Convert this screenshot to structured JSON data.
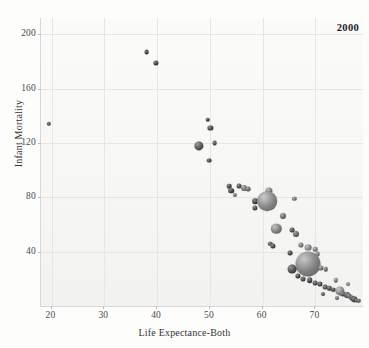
{
  "chart_data": {
    "type": "scatter",
    "title": "",
    "annotation": "2000",
    "xlabel": "Life Expectance-Both",
    "ylabel": "Infant Mortality",
    "xlim": [
      18,
      79
    ],
    "ylim": [
      0,
      212
    ],
    "xticks": [
      20,
      30,
      40,
      50,
      60,
      70
    ],
    "yticks": [
      40,
      80,
      120,
      160,
      200
    ],
    "grid": true,
    "legend": "none",
    "bubble_encoding": "marker size encodes population; shading is grayscale sphere",
    "points": [
      {
        "x": 19.5,
        "y": 134,
        "r": 2.2,
        "tone": 0.3
      },
      {
        "x": 38.0,
        "y": 187,
        "r": 2.4,
        "tone": 0.22
      },
      {
        "x": 39.8,
        "y": 179,
        "r": 2.6,
        "tone": 0.25
      },
      {
        "x": 49.6,
        "y": 137,
        "r": 2.3,
        "tone": 0.24
      },
      {
        "x": 50.1,
        "y": 131,
        "r": 2.6,
        "tone": 0.28
      },
      {
        "x": 50.9,
        "y": 120,
        "r": 2.4,
        "tone": 0.3
      },
      {
        "x": 47.9,
        "y": 118,
        "r": 4.6,
        "tone": 0.34
      },
      {
        "x": 49.9,
        "y": 107,
        "r": 2.4,
        "tone": 0.26
      },
      {
        "x": 53.6,
        "y": 88,
        "r": 2.3,
        "tone": 0.26
      },
      {
        "x": 54.0,
        "y": 85,
        "r": 2.8,
        "tone": 0.24
      },
      {
        "x": 54.8,
        "y": 82,
        "r": 2.1,
        "tone": 0.48
      },
      {
        "x": 55.6,
        "y": 88,
        "r": 2.5,
        "tone": 0.3
      },
      {
        "x": 56.4,
        "y": 87,
        "r": 3.0,
        "tone": 0.52
      },
      {
        "x": 57.3,
        "y": 86,
        "r": 2.4,
        "tone": 0.44
      },
      {
        "x": 61.2,
        "y": 85,
        "r": 3.6,
        "tone": 0.56
      },
      {
        "x": 58.6,
        "y": 77,
        "r": 2.8,
        "tone": 0.26
      },
      {
        "x": 58.5,
        "y": 72,
        "r": 2.6,
        "tone": 0.3
      },
      {
        "x": 60.8,
        "y": 77,
        "r": 9.8,
        "tone": 0.62
      },
      {
        "x": 66.0,
        "y": 79,
        "r": 2.2,
        "tone": 0.5
      },
      {
        "x": 63.9,
        "y": 66,
        "r": 3.0,
        "tone": 0.46
      },
      {
        "x": 62.6,
        "y": 57,
        "r": 5.2,
        "tone": 0.58
      },
      {
        "x": 65.6,
        "y": 56,
        "r": 2.4,
        "tone": 0.3
      },
      {
        "x": 66.4,
        "y": 53,
        "r": 3.0,
        "tone": 0.4
      },
      {
        "x": 61.4,
        "y": 46,
        "r": 2.3,
        "tone": 0.34
      },
      {
        "x": 61.9,
        "y": 44,
        "r": 2.6,
        "tone": 0.28
      },
      {
        "x": 67.3,
        "y": 45,
        "r": 2.6,
        "tone": 0.52
      },
      {
        "x": 68.6,
        "y": 43,
        "r": 3.4,
        "tone": 0.6
      },
      {
        "x": 69.9,
        "y": 42,
        "r": 2.3,
        "tone": 0.56
      },
      {
        "x": 65.2,
        "y": 39,
        "r": 2.4,
        "tone": 0.26
      },
      {
        "x": 70.4,
        "y": 38,
        "r": 2.4,
        "tone": 0.5
      },
      {
        "x": 68.5,
        "y": 31,
        "r": 12.5,
        "tone": 0.6
      },
      {
        "x": 65.6,
        "y": 27,
        "r": 4.4,
        "tone": 0.3
      },
      {
        "x": 71.0,
        "y": 28,
        "r": 2.6,
        "tone": 0.52
      },
      {
        "x": 72.0,
        "y": 27,
        "r": 2.2,
        "tone": 0.44
      },
      {
        "x": 66.6,
        "y": 22,
        "r": 2.6,
        "tone": 0.26
      },
      {
        "x": 67.6,
        "y": 20,
        "r": 2.5,
        "tone": 0.28
      },
      {
        "x": 68.9,
        "y": 19,
        "r": 2.8,
        "tone": 0.26
      },
      {
        "x": 70.0,
        "y": 17,
        "r": 2.4,
        "tone": 0.3
      },
      {
        "x": 70.9,
        "y": 16,
        "r": 2.6,
        "tone": 0.28
      },
      {
        "x": 71.8,
        "y": 14,
        "r": 2.4,
        "tone": 0.32
      },
      {
        "x": 72.6,
        "y": 13,
        "r": 2.2,
        "tone": 0.3
      },
      {
        "x": 73.4,
        "y": 12,
        "r": 2.3,
        "tone": 0.26
      },
      {
        "x": 73.8,
        "y": 19,
        "r": 2.2,
        "tone": 0.52
      },
      {
        "x": 74.6,
        "y": 11,
        "r": 4.6,
        "tone": 0.62
      },
      {
        "x": 75.2,
        "y": 9,
        "r": 2.6,
        "tone": 0.34
      },
      {
        "x": 75.9,
        "y": 8,
        "r": 3.0,
        "tone": 0.3
      },
      {
        "x": 76.4,
        "y": 7,
        "r": 2.4,
        "tone": 0.4
      },
      {
        "x": 76.9,
        "y": 6,
        "r": 2.6,
        "tone": 0.28
      },
      {
        "x": 77.3,
        "y": 5,
        "r": 2.8,
        "tone": 0.26
      },
      {
        "x": 77.8,
        "y": 4,
        "r": 2.4,
        "tone": 0.3
      },
      {
        "x": 78.2,
        "y": 4,
        "r": 2.2,
        "tone": 0.36
      },
      {
        "x": 76.2,
        "y": 16,
        "r": 2.0,
        "tone": 0.55
      },
      {
        "x": 74.0,
        "y": 6,
        "r": 2.0,
        "tone": 0.45
      },
      {
        "x": 71.5,
        "y": 9,
        "r": 2.0,
        "tone": 0.35
      }
    ]
  },
  "axes": {
    "x_title": "Life Expectance-Both",
    "y_title": "Infant Mortality"
  }
}
